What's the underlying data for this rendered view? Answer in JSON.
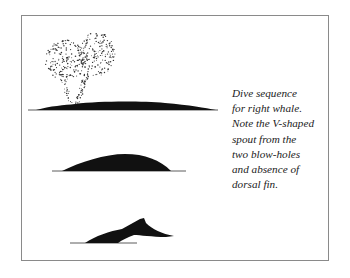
{
  "figure": {
    "caption_lines": [
      "Dive sequence",
      "for right whale.",
      "Note the V-shaped",
      "spout from the",
      "two blow-holes",
      "and absence of",
      "dorsal fin."
    ],
    "stages": [
      {
        "name": "surfacing-with-spout",
        "description": "Whale back at surface with V-shaped spout"
      },
      {
        "name": "arching-back",
        "description": "Whale back arching before dive"
      },
      {
        "name": "fluke-raise",
        "description": "Tail flukes rising as whale dives"
      }
    ],
    "colors": {
      "ink": "#111111",
      "frame": "#8a8a8a",
      "background": "#ffffff"
    }
  }
}
